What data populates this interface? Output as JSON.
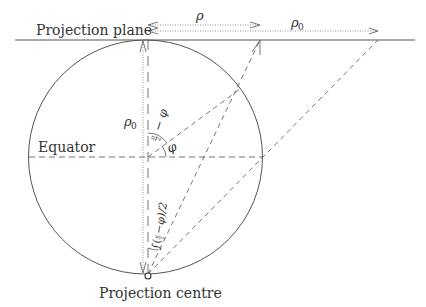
{
  "diagram": {
    "type": "stereographic-projection-geometry",
    "labels": {
      "projection_plane": "Projection plane",
      "equator": "Equator",
      "projection_centre": "Projection centre",
      "rho": "ρ",
      "rho0_top": "ρ",
      "rho0_top_sub": "0",
      "rho0_left": "ρ",
      "rho0_left_sub": "0",
      "phi": "φ",
      "angle_upper": "π/2 − φ",
      "angle_upper_pi": "π",
      "angle_upper_two": "2",
      "angle_upper_rest": "− φ",
      "angle_lower": "(π/2 − φ)/2",
      "angle_lower_text": "(",
      "angle_lower_rest": "−φ)/2"
    },
    "colors": {
      "stroke": "#555555",
      "text": "#333333",
      "background": "#ffffff"
    }
  }
}
